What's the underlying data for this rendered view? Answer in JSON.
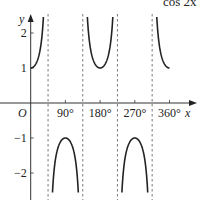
{
  "chart_data": {
    "type": "line",
    "title_fragment": "cos 2x",
    "function": "y = sec 2x = 1 / cos 2x",
    "xlabel": "x",
    "ylabel": "y",
    "origin_label": "O",
    "x_unit": "degrees",
    "xlim": [
      0,
      360
    ],
    "ylim": [
      -2.6,
      2.5
    ],
    "x_ticks": [
      {
        "value": 90,
        "label": "90°"
      },
      {
        "value": 180,
        "label": "180°"
      },
      {
        "value": 270,
        "label": "270°"
      },
      {
        "value": 360,
        "label": "360°"
      }
    ],
    "y_ticks": [
      {
        "value": 2,
        "label": "2"
      },
      {
        "value": 1,
        "label": "1"
      },
      {
        "value": -1,
        "label": "−1"
      },
      {
        "value": -2,
        "label": "−2"
      }
    ],
    "asymptotes": [
      45,
      135,
      225,
      315
    ],
    "branches": [
      {
        "from": 0,
        "to": 45,
        "turning_point": {
          "x": 0,
          "y": 1
        }
      },
      {
        "from": 45,
        "to": 135,
        "turning_point": {
          "x": 90,
          "y": -1
        }
      },
      {
        "from": 135,
        "to": 225,
        "turning_point": {
          "x": 180,
          "y": 1
        }
      },
      {
        "from": 225,
        "to": 315,
        "turning_point": {
          "x": 270,
          "y": -1
        }
      },
      {
        "from": 315,
        "to": 360,
        "turning_point": {
          "x": 360,
          "y": 1
        }
      }
    ],
    "grid": false,
    "legend": "none"
  }
}
